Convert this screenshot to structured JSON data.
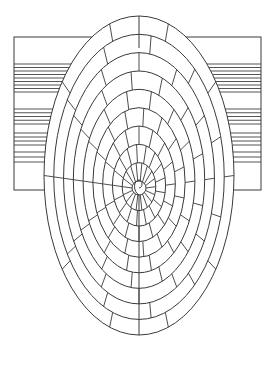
{
  "colors": {
    "stroke": "#3a3a3a",
    "background": "#ffffff",
    "stripe": "#555555"
  },
  "rect": {
    "x": 14,
    "y": 37,
    "w": 247,
    "h": 153
  },
  "stripe_bands": [
    {
      "y0": 64,
      "y1": 92,
      "lines": 9
    },
    {
      "y0": 109,
      "y1": 124,
      "lines": 5
    },
    {
      "y0": 133,
      "y1": 145,
      "lines": 4
    },
    {
      "y0": 152,
      "y1": 162,
      "lines": 3
    }
  ],
  "spiral": {
    "cx": 139,
    "cy": 185,
    "turns": 9,
    "seam_x": 139
  }
}
